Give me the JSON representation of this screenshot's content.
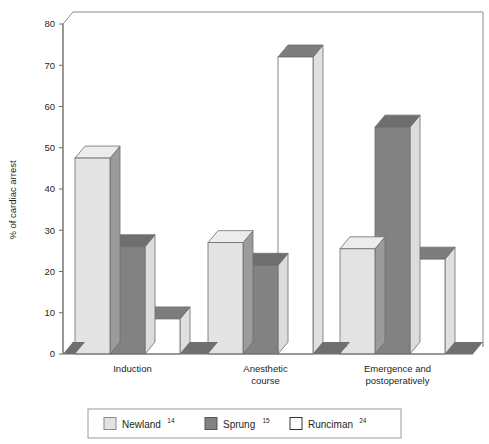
{
  "chart_data": {
    "type": "bar",
    "title": "",
    "subtitle": "",
    "xlabel": "",
    "ylabel": "% of cardiac arrest",
    "ylim": [
      0,
      80
    ],
    "yticks": [
      0,
      10,
      20,
      30,
      40,
      50,
      60,
      70,
      80
    ],
    "ytick_labels": [
      "0",
      "10",
      "20",
      "30",
      "40",
      "50",
      "60",
      "70",
      "80"
    ],
    "grid": false,
    "legend_position": "bottom",
    "style": "3d-clustered-column",
    "categories": [
      "Induction",
      "Anesthetic course",
      "Emergence and postoperatively"
    ],
    "category_lines": [
      [
        "Induction"
      ],
      [
        "Anesthetic",
        "course"
      ],
      [
        "Emergence and",
        "postoperatively"
      ]
    ],
    "series": [
      {
        "name": "Newland",
        "ref": "14",
        "color": "#e3e3e3",
        "side_color": "#9b9b9b",
        "top_color": "#ececec",
        "values": [
          47.5,
          27,
          25.5
        ]
      },
      {
        "name": "Sprung",
        "ref": "15",
        "color": "#828282",
        "side_color": "#dcdcdc",
        "top_color": "#6f6f6f",
        "values": [
          26,
          21.5,
          55
        ]
      },
      {
        "name": "Runciman",
        "ref": "24",
        "color": "#ffffff",
        "side_color": "#e0e0e0",
        "top_color": "#7d7d7d",
        "values": [
          8.5,
          72,
          23
        ]
      }
    ]
  },
  "legend": {
    "entries": [
      {
        "label": "Newland",
        "sup": "14",
        "swatch": "#e3e3e3",
        "border": "#8a8a8a"
      },
      {
        "label": "Sprung",
        "sup": "15",
        "swatch": "#828282",
        "border": "#555555"
      },
      {
        "label": "Runciman",
        "sup": "24",
        "swatch": "#ffffff",
        "border": "#333333"
      }
    ]
  },
  "colors": {
    "axis": "#6e6e6e",
    "frame": "#8c8c8c",
    "floor": "#6f6f6f",
    "text": "#231f20",
    "legend_border": "#9a9a9a"
  }
}
